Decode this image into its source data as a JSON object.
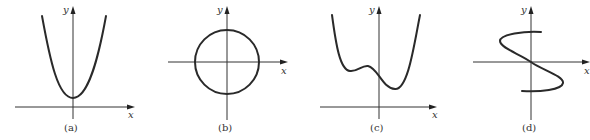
{
  "figure": {
    "panels": [
      {
        "id": "a",
        "label": "(a)",
        "x_axis_label": "x",
        "y_axis_label": "y",
        "shape": "parabola opening upward, vertex above x-axis on y-axis"
      },
      {
        "id": "b",
        "label": "(b)",
        "x_axis_label": "x",
        "y_axis_label": "y",
        "shape": "circle centered at origin"
      },
      {
        "id": "c",
        "label": "(c)",
        "x_axis_label": "x",
        "y_axis_label": "y",
        "shape": "quartic-like curve above x-axis with two local minima and one local maximum"
      },
      {
        "id": "d",
        "label": "(d)",
        "x_axis_label": "x",
        "y_axis_label": "y",
        "shape": "S-shaped curve through origin (not a function of x)"
      }
    ],
    "colors": {
      "curve": "#2a2a2a",
      "axis": "#333333",
      "background": "#ffffff"
    }
  }
}
